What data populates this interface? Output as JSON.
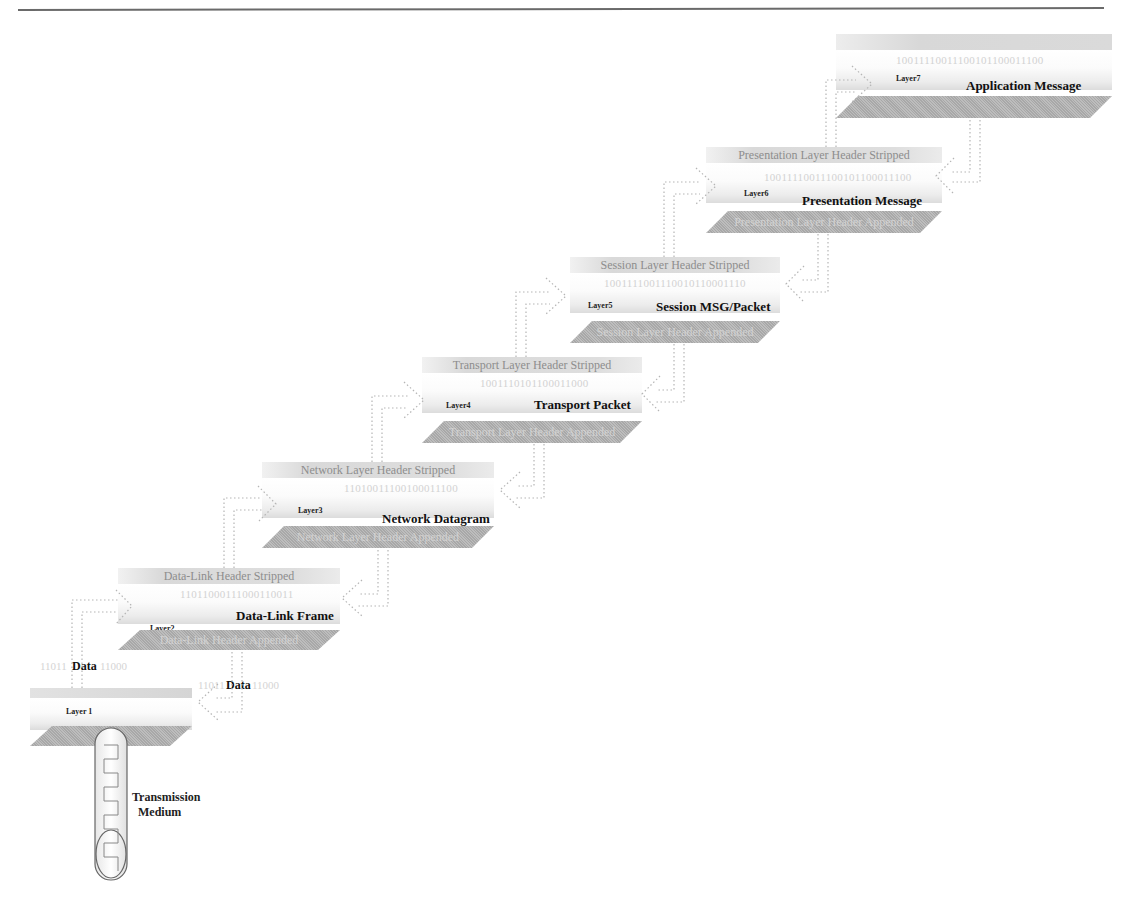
{
  "layers": [
    {
      "name": "Layer 1",
      "title": "",
      "binary": "",
      "stripped": "",
      "appended": ""
    },
    {
      "name": "Layer2",
      "title": "Data-Link Frame",
      "binary": "11011000111000110011",
      "stripped": "Data-Link Header Stripped",
      "appended": "Data-Link Header Appended"
    },
    {
      "name": "Layer3",
      "title": "Network Datagram",
      "binary": "11010011100100011100",
      "stripped": "Network Layer Header Stripped",
      "appended": "Network Layer Header Appended"
    },
    {
      "name": "Layer4",
      "title": "Transport Packet",
      "binary": "1001110101100011000",
      "stripped": "Transport Layer Header Stripped",
      "appended": "Transport Layer Header Appended"
    },
    {
      "name": "Layer5",
      "title": "Session MSG/Packet",
      "binary": "1001111001110010110001110",
      "stripped": "Session Layer Header Stripped",
      "appended": "Session Layer Header Appended"
    },
    {
      "name": "Layer6",
      "title": "Presentation Message",
      "binary": "10011110011100101100011100",
      "stripped": "Presentation Layer Header Stripped",
      "appended": "Presentation Layer Header Appended"
    },
    {
      "name": "Layer7",
      "title": "Application Message",
      "binary": "10011110011100101100011100",
      "stripped": "",
      "appended": ""
    }
  ],
  "data_labels": {
    "left_data": "Data",
    "left_binary_a": "11011",
    "left_binary_b": "11000",
    "right_data": "Data",
    "right_binary_a": "11011",
    "right_binary_b": "11000"
  },
  "medium": {
    "line1": "Transmission",
    "line2": "Medium"
  }
}
